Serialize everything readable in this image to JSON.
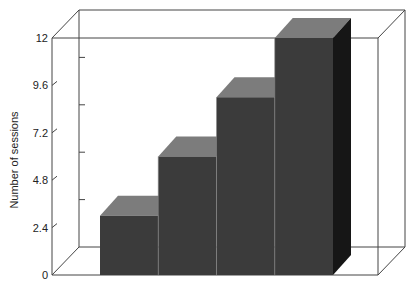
{
  "chart_data": {
    "type": "bar",
    "style": "3d",
    "title": "",
    "xlabel": "",
    "ylabel": "Number of sessions",
    "categories": [
      "1",
      "2",
      "3",
      "4"
    ],
    "values": [
      3,
      6,
      9,
      12
    ],
    "ylim": [
      0,
      12
    ],
    "yticks": [
      "0",
      "2.4",
      "4.8",
      "7.2",
      "9.6",
      "12"
    ],
    "grid": false,
    "legend": null,
    "colors": {
      "front": "#3b3b3b",
      "top": "#7c7c7c",
      "side": "#161616",
      "frame": "#444444"
    }
  }
}
